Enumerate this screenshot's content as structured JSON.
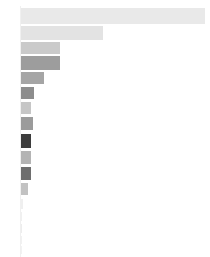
{
  "chart_data": {
    "type": "bar",
    "orientation": "horizontal",
    "title": "",
    "subtitle": "",
    "xlabel": "",
    "ylabel": "",
    "grid": false,
    "legend": null,
    "legend_position": "none",
    "xlim": [
      0,
      186
    ],
    "categories": [
      "item-1",
      "item-2",
      "item-3",
      "item-4",
      "item-5",
      "item-6",
      "item-7",
      "item-8",
      "item-9",
      "item-10",
      "item-11",
      "item-12",
      "item-13",
      "item-14",
      "item-15",
      "item-16",
      "item-17"
    ],
    "values": [
      184,
      82,
      39,
      39,
      23,
      13,
      10,
      12,
      10,
      10,
      10,
      7,
      2,
      1,
      1,
      1,
      1
    ],
    "tick_labels": [],
    "bars": [
      {
        "name": "bar-1",
        "value": 184,
        "color": "#e9e9e9",
        "x": 21,
        "y": 8,
        "w": 184,
        "h": 16
      },
      {
        "name": "bar-2",
        "value": 82,
        "color": "#e3e3e3",
        "x": 21,
        "y": 26,
        "w": 82,
        "h": 14
      },
      {
        "name": "bar-3",
        "value": 39,
        "color": "#cacaca",
        "x": 21,
        "y": 42,
        "w": 39,
        "h": 12
      },
      {
        "name": "bar-4",
        "value": 39,
        "color": "#9d9d9d",
        "x": 21,
        "y": 56,
        "w": 39,
        "h": 14
      },
      {
        "name": "bar-5",
        "value": 23,
        "color": "#a5a5a5",
        "x": 21,
        "y": 72,
        "w": 23,
        "h": 12
      },
      {
        "name": "bar-6",
        "value": 13,
        "color": "#8d8d8d",
        "x": 21,
        "y": 87,
        "w": 13,
        "h": 12
      },
      {
        "name": "bar-7",
        "value": 10,
        "color": "#c6c6c6",
        "x": 21,
        "y": 102,
        "w": 10,
        "h": 12
      },
      {
        "name": "bar-8",
        "value": 12,
        "color": "#9b9b9b",
        "x": 21,
        "y": 117,
        "w": 12,
        "h": 13
      },
      {
        "name": "bar-9",
        "value": 10,
        "color": "#3c3c3c",
        "x": 21,
        "y": 134,
        "w": 10,
        "h": 14
      },
      {
        "name": "bar-10",
        "value": 10,
        "color": "#b4b4b4",
        "x": 21,
        "y": 151,
        "w": 10,
        "h": 13
      },
      {
        "name": "bar-11",
        "value": 10,
        "color": "#6e6e6e",
        "x": 21,
        "y": 167,
        "w": 10,
        "h": 13
      },
      {
        "name": "bar-12",
        "value": 7,
        "color": "#c2c2c2",
        "x": 21,
        "y": 183,
        "w": 7,
        "h": 12
      },
      {
        "name": "bar-13",
        "value": 2,
        "color": "#efefef",
        "x": 21,
        "y": 199,
        "w": 2,
        "h": 10
      },
      {
        "name": "bar-14",
        "value": 1,
        "color": "#f0f0f0",
        "x": 21,
        "y": 212,
        "w": 1,
        "h": 9
      },
      {
        "name": "bar-15",
        "value": 1,
        "color": "#ededed",
        "x": 21,
        "y": 224,
        "w": 1,
        "h": 9
      },
      {
        "name": "bar-16",
        "value": 1,
        "color": "#f1f1f1",
        "x": 21,
        "y": 236,
        "w": 1,
        "h": 8
      },
      {
        "name": "bar-17",
        "value": 1,
        "color": "#f2f2f2",
        "x": 21,
        "y": 246,
        "w": 1,
        "h": 8
      }
    ],
    "axis": {
      "color": "#f0f0f0",
      "x": 20,
      "y": 6,
      "width": 1,
      "height": 251
    },
    "background_color": "#ffffff"
  }
}
